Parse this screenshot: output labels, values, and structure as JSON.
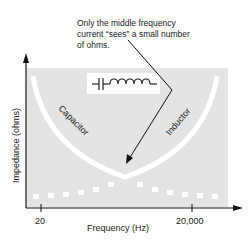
{
  "annotation": {
    "line1": "Only the middle frequency",
    "line2": "current “sees” a small number",
    "line3": "of ohms."
  },
  "axes": {
    "ylabel": "Impedance (ohms)",
    "xlabel": "Frequency (Hz)",
    "xticks": [
      "20",
      "20,000"
    ]
  },
  "curves": {
    "left_label": "Capacitor",
    "right_label": "Inductor"
  },
  "circuit_symbol": "capacitor-inductor-series-icon",
  "colors": {
    "panel": "#e4e4e4",
    "curve": "#ffffff",
    "ink": "#222222"
  }
}
